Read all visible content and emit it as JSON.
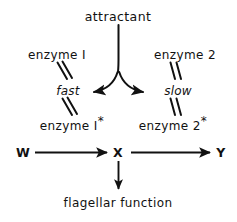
{
  "diagram": {
    "title": "attractant",
    "background_color": "#ffffff",
    "ink_color": "#111111",
    "labels": {
      "attractant": "attractant",
      "enzyme_1": "enzyme I",
      "enzyme_2": "enzyme 2",
      "fast": "fast",
      "slow": "slow",
      "enzyme_1_star_base": "enzyme I",
      "enzyme_1_star_mark": "*",
      "enzyme_2_star_base": "enzyme 2",
      "enzyme_2_star_mark": "*",
      "node_w": "W",
      "node_x": "X",
      "node_y": "Y",
      "flagellar_function": "flagellar function"
    },
    "connections": [
      {
        "name": "attractant-stem",
        "from": "attractant",
        "to": "fork-point",
        "style": "line"
      },
      {
        "name": "attractant-to-fast",
        "from": "attractant",
        "to": "fast",
        "style": "curved-arrow",
        "direction": "left-down"
      },
      {
        "name": "attractant-to-slow",
        "from": "attractant",
        "to": "slow",
        "style": "curved-arrow",
        "direction": "right-down"
      },
      {
        "name": "enzyme-1-to-fast",
        "from": "enzyme I",
        "to": "fast",
        "style": "double-slash-reversible"
      },
      {
        "name": "fast-to-enzyme-1-star",
        "from": "fast",
        "to": "enzyme I*",
        "style": "double-slash-reversible"
      },
      {
        "name": "enzyme-2-to-slow",
        "from": "enzyme 2",
        "to": "slow",
        "style": "double-slash-reversible"
      },
      {
        "name": "slow-to-enzyme-2-star",
        "from": "slow",
        "to": "enzyme 2*",
        "style": "double-slash-reversible"
      },
      {
        "name": "w-to-x",
        "from": "W",
        "to": "X",
        "style": "arrow",
        "direction": "right"
      },
      {
        "name": "x-to-y",
        "from": "X",
        "to": "Y",
        "style": "arrow",
        "direction": "right"
      },
      {
        "name": "x-to-flagellar-function",
        "from": "X",
        "to": "flagellar function",
        "style": "arrow",
        "direction": "down"
      }
    ]
  }
}
